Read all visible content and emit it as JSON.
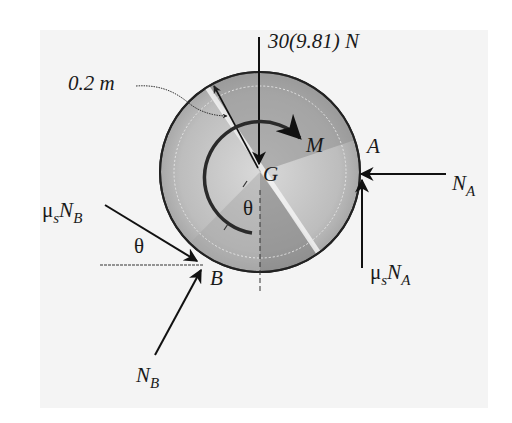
{
  "figure": {
    "type": "free-body diagram",
    "background": "#f4f4f4",
    "body": {
      "shape": "disk",
      "center_label": "G",
      "radius_label": "0.2 m"
    },
    "labels": {
      "weight": "30(9.81) N",
      "radius": "0.2 m",
      "moment": "M",
      "center": "G",
      "point_a": "A",
      "point_b": "B",
      "angle_center": "θ",
      "angle_b": "θ",
      "na_main": "N",
      "na_sub": "A",
      "musna_mu": "μ",
      "musna_s": "s",
      "musna_n": "N",
      "musna_sub": "A",
      "musnb_mu": "μ",
      "musnb_s": "s",
      "musnb_n": "N",
      "musnb_sub": "B",
      "nb_main": "N",
      "nb_sub": "B"
    },
    "forces": [
      {
        "name": "weight",
        "label": "30(9.81) N",
        "direction": "down",
        "at": "G"
      },
      {
        "name": "normal-A",
        "label": "N_A",
        "direction": "left",
        "at": "A"
      },
      {
        "name": "friction-A",
        "label": "μ_s N_A",
        "direction": "up",
        "at": "A"
      },
      {
        "name": "friction-B",
        "label": "μ_s N_B",
        "direction": "down-right at θ",
        "at": "B"
      },
      {
        "name": "normal-B",
        "label": "N_B",
        "direction": "up-right",
        "at": "B"
      },
      {
        "name": "moment",
        "label": "M",
        "direction": "clockwise",
        "at": "G"
      }
    ]
  }
}
